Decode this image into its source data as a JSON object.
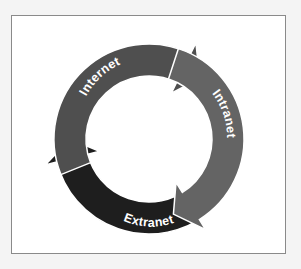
{
  "diagram": {
    "type": "cycle",
    "segments": [
      {
        "id": "internet",
        "label": "Internet",
        "color": "#4f4f4f"
      },
      {
        "id": "intranet",
        "label": "Intranet",
        "color": "#646464"
      },
      {
        "id": "extranet",
        "label": "Extranet",
        "color": "#1e1e1e"
      }
    ],
    "direction": "clockwise"
  }
}
